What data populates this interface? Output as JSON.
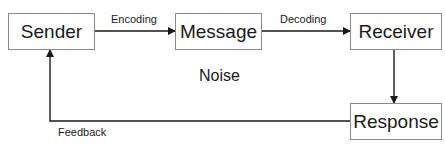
{
  "diagram": {
    "nodes": [
      {
        "id": "sender",
        "label": "Sender"
      },
      {
        "id": "message",
        "label": "Message"
      },
      {
        "id": "receiver",
        "label": "Receiver"
      },
      {
        "id": "response",
        "label": "Response"
      }
    ],
    "edges": [
      {
        "from": "sender",
        "to": "message",
        "label": "Encoding"
      },
      {
        "from": "message",
        "to": "receiver",
        "label": "Decoding"
      },
      {
        "from": "receiver",
        "to": "response",
        "label": ""
      },
      {
        "from": "response",
        "to": "sender",
        "label": "Feedback"
      }
    ],
    "noise_label": "Noise",
    "colors": {
      "line": "#1a1a1a",
      "box_border": "#8a8a8a",
      "text": "#1a1a1a"
    }
  }
}
